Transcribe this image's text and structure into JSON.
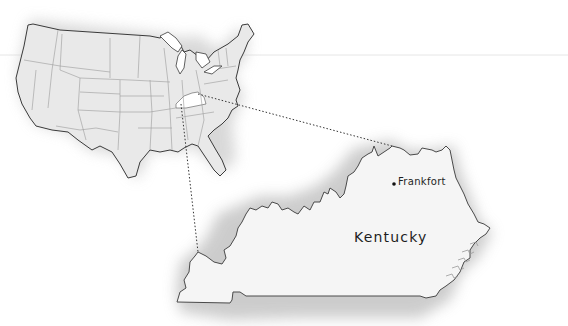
{
  "map": {
    "overview": {
      "name": "United States",
      "highlighted_state": "Kentucky"
    },
    "detail": {
      "state_label": "Kentucky",
      "capital_label": "Frankfort"
    },
    "colors": {
      "land": "#e9e9e9",
      "state_fill": "#f4f4f4",
      "highlight": "#ffffff",
      "outline": "#555555",
      "inner_border": "#9a9a9a",
      "shadow": "#c8c8c8",
      "text": "#1e1e1e"
    }
  }
}
